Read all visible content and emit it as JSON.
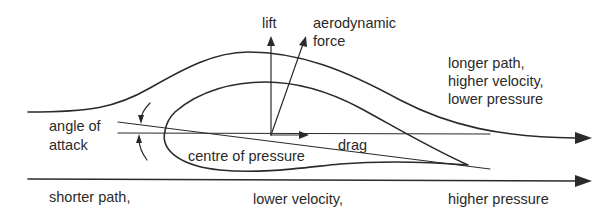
{
  "diagram": {
    "colors": {
      "ink": "#2a2a2a",
      "background": "#ffffff"
    },
    "labels": {
      "lift": "lift",
      "aero_force_line1": "aerodynamic",
      "aero_force_line2": "force",
      "upper_line1": "longer path,",
      "upper_line2": "higher velocity,",
      "upper_line3": "lower pressure",
      "angle_line1": "angle of",
      "angle_line2": "attack",
      "drag": "drag",
      "centre_of_pressure": "centre of pressure",
      "lower_shorter": "shorter path,",
      "lower_velocity": "lower velocity,",
      "lower_pressure": "higher pressure"
    },
    "elements": [
      "upper-streamline-arrow",
      "airfoil-outline",
      "chord-line",
      "horizontal-reference-line",
      "lift-arrow",
      "aerodynamic-force-arrow",
      "drag-arrow",
      "angle-of-attack-arc",
      "lower-streamline-arrow"
    ]
  }
}
